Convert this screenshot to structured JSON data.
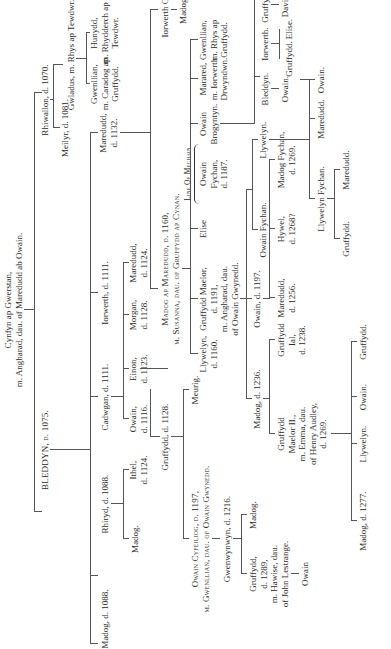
{
  "diagram": {
    "type": "genealogical-tree",
    "orientation": "rotated-90-ccw",
    "line_color": "#555555",
    "text_color": "#2a2a2a",
    "people": {
      "cynfyn": "Cynfyn ap Gwerstan,",
      "cynfyn_m": "m. Angharad, dau. of Maredudd ab Owain.",
      "bleddyn": "BLEDDYN, d. 1075.",
      "rhiwallon": "Rhiwallon, d. 1070.",
      "meilyr": "Meilyr, d. 1081.",
      "gwladus": "Gwladus, m. Rhys ap Tewdwr.",
      "madog1088": "Madog, d. 1088.",
      "rhirid": "Rhiryd, d. 1088.",
      "cadwgan": "Cadwgan, d. 1111.",
      "iorwerth1111": "Iorwerth, d. 1111.",
      "maredudd1132_1": "Maredudd,",
      "maredudd1132_2": "d. 1132.",
      "gwenllian_c_1": "Gwenllian,",
      "gwenllian_c_2": "m. Caradog ap",
      "gwenllian_c_3": "Gruffydd.",
      "hunydd_1": "Hunydd,",
      "hunydd_2": "m. Rhydderch ap",
      "hunydd_3": "Tewdwr.",
      "madog_r": "Madog.",
      "ithel_1": "Ithel,",
      "ithel_2": "d. 1124.",
      "owain1116_1": "Owain,",
      "owain1116_2": "d. 1116.",
      "einon_1": "Einon,",
      "einon_2": "d. 1123.",
      "morgan_1": "Morgan,",
      "morgan_2": "d. 1128.",
      "maredudd1124_1": "Maredudd,",
      "maredudd1124_2": "d. 1124.",
      "gruffydd1128": "Gruffydd, d. 1128.",
      "madog_ap_m": "Madog ap Maredudd, d. 1160,",
      "madog_ap_m_wife": "m. Susanna, dau. of Gruffydd ap Cynan.",
      "iorwerth_goch": "Iorwerth Goch.",
      "madog_ig": "Madog.",
      "owain_cyf": "Owain Cyfeiliog, d. 1197,",
      "owain_cyf_wife": "m. Gwenllian, dau. of Owain Gwynedd.",
      "meurig": "Meurig.",
      "gwenwynwyn": "Gwenwynwyn, d. 1216.",
      "llywelyn1160_1": "Llywelyn,",
      "llywelyn1160_2": "d. 1160.",
      "gruffydd_maelor_1": "Gruffydd Maelor,",
      "gruffydd_maelor_2": "d. 1191,",
      "gruffydd_maelor_3": "m. Angharad, dau.",
      "gruffydd_maelor_4": "of Owain Gwynedd.",
      "elise": "Elise",
      "line_of_mechain": "Line Of Mechain",
      "owain_fychan_1": "Owain",
      "owain_fychan_2": "Fychan,",
      "owain_fychan_3": "d. 1187.",
      "owain_brog_1": "Owain",
      "owain_brog_2": "Brogyntyn.",
      "marared_1": "Marared,",
      "marared_2": "m. Iorwerth",
      "marared_3": "Drwyndwn.",
      "gwenllian_r_1": "Gwenllian,",
      "gwenllian_r_2": "m. Rhys ap",
      "gwenllian_r_3": "Gruffydd.",
      "gruffydd1289_1": "Gruffydd,",
      "gruffydd1289_2": "d. 1289,",
      "gruffydd1289_3": "m. Hawise, dau.",
      "gruffydd1289_4": "of John Lestrange.",
      "owain_g": "Owain",
      "madog_g": "Madog.",
      "madog1236": "Madog, d. 1236.",
      "owain1197": "Owain, d. 1197.",
      "owain_fychan_b": "Owain Fychan.",
      "llywelyn_b": "Llywelyn.",
      "bleddyn_b": "Bleddyn.",
      "owain_bb": "Owain.",
      "iorwerth_b": "Iorwerth.",
      "gruffydd_ib": "Gruffydd.",
      "elise_ib": "Elise.",
      "gruffydd_b": "Gruffydd.",
      "david_b": "David.",
      "gm2_1": "Gruffydd",
      "gm2_2": "Maelor II.,",
      "gm2_3": "m. Emma, dau.",
      "gm2_4": "of Henry Audley,",
      "gm2_5": "d. 1269.",
      "gi_1": "Gruffydd",
      "gi_2": "Ial,",
      "gi_3": "d. 1238.",
      "maredudd1256_1": "Maredudd,",
      "maredudd1256_2": "d. 1256.",
      "hywel_1": "Hywel,",
      "hywel_2": "d. 1268?",
      "madog_fychan_1": "Madog Fychan,",
      "madog_fychan_2": "d. 1269.",
      "llywelyn_fychan": "Llywelyn Fychan.",
      "maredudd_l": "Maredudd.",
      "owain_l": "Owain.",
      "gruffydd_lf": "Gruffydd.",
      "maredudd_lf": "Maredudd.",
      "madog1277": "Madog, d. 1277.",
      "llywelyn_gm": "Llywelyn.",
      "owain_gm": "Owain.",
      "gruffydd_gm": "Gruffydd."
    }
  }
}
